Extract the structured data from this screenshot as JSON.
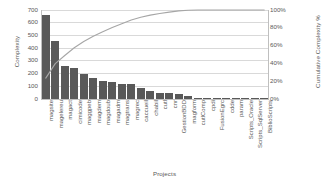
{
  "chart_data": {
    "type": "bar",
    "title": "",
    "subtitle": "",
    "xlabel": "Projects",
    "ylabel": "Complexity",
    "y2label": "Cumulative Complexity %",
    "grid": true,
    "legend": "none",
    "ylim": [
      0,
      700
    ],
    "y2lim": [
      0,
      100
    ],
    "yticks": [
      "0",
      "100",
      "200",
      "300",
      "400",
      "500",
      "600",
      "700"
    ],
    "ytick_values": [
      0,
      100,
      200,
      300,
      400,
      500,
      600,
      700
    ],
    "y2ticks": [
      "0%",
      "20%",
      "40%",
      "60%",
      "80%",
      "100%"
    ],
    "y2tick_values": [
      0,
      20,
      40,
      60,
      80,
      100
    ],
    "categories": [
      "magsite",
      "magelereu",
      "magact",
      "cimicode",
      "maggpeb",
      "magdem",
      "magdoub",
      "magadm",
      "magtrans",
      "magrec",
      "caccueil",
      "chabil",
      "cutl",
      "cnr",
      "GestionBDD",
      "magform",
      "cutlComp",
      "cpdi",
      "FusionEgrc",
      "cdde",
      "param",
      "Scripts_Oracle",
      "Scripts_SqlServer",
      "BiblioScripts"
    ],
    "series": [
      {
        "name": "Complexity",
        "type": "bar",
        "axis": "left",
        "color": "#595959",
        "values": [
          660,
          455,
          258,
          245,
          200,
          165,
          140,
          133,
          120,
          115,
          90,
          65,
          50,
          45,
          38,
          20,
          8,
          5,
          4,
          3,
          2,
          2,
          1,
          1
        ]
      },
      {
        "name": "Cumulative Complexity %",
        "type": "line",
        "axis": "right",
        "color": "#a6a6a6",
        "values": [
          23.5,
          39.7,
          48.9,
          57.6,
          64.7,
          70.6,
          75.6,
          80.3,
          84.6,
          88.7,
          91.9,
          94.2,
          96.0,
          97.6,
          99.0,
          99.7,
          100.0,
          100.0,
          100.0,
          100.0,
          100.0,
          100.0,
          100.0,
          100.0
        ]
      }
    ],
    "colors": {
      "bar": "#595959",
      "line": "#a6a6a6",
      "grid": "#d9d9d9",
      "axis": "#bfbfbf",
      "text": "#595959",
      "background": "#ffffff"
    }
  }
}
